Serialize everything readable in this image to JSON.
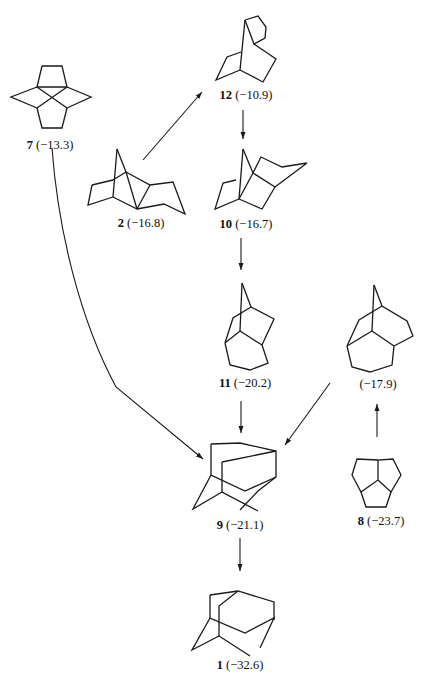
{
  "figure": {
    "type": "reaction-network"
  },
  "compounds": [
    {
      "id": "7",
      "label_num": "7",
      "value": "(−13.3)"
    },
    {
      "id": "2",
      "label_num": "2",
      "value": "(−16.8)"
    },
    {
      "id": "12",
      "label_num": "12",
      "value": "(−10.9)"
    },
    {
      "id": "10",
      "label_num": "10",
      "value": "(−16.7)"
    },
    {
      "id": "11",
      "label_num": "11",
      "value": "(−20.2)"
    },
    {
      "id": "unlabeled",
      "label_num": "",
      "value": "(−17.9)"
    },
    {
      "id": "8",
      "label_num": "8",
      "value": "(−23.7)"
    },
    {
      "id": "9",
      "label_num": "9",
      "value": "(−21.1)"
    },
    {
      "id": "1",
      "label_num": "1",
      "value": "(−32.6)"
    }
  ],
  "arrows": [
    {
      "from": "2",
      "to": "12"
    },
    {
      "from": "12",
      "to": "10"
    },
    {
      "from": "10",
      "to": "11"
    },
    {
      "from": "11",
      "to": "9"
    },
    {
      "from": "7",
      "to": "9"
    },
    {
      "from": "8",
      "to": "unlabeled"
    },
    {
      "from": "unlabeled",
      "to": "9"
    },
    {
      "from": "9",
      "to": "1"
    }
  ]
}
